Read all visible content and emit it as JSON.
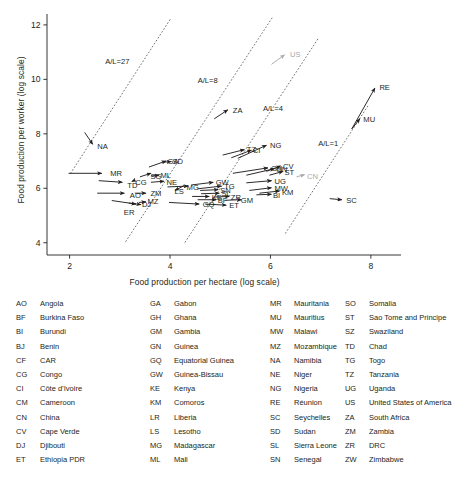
{
  "chart_data": {
    "type": "scatter",
    "title": "",
    "xlabel": "Food production per hectare (log scale)",
    "ylabel": "Food production per worker (log scale)",
    "xlim": [
      1.55,
      8.6
    ],
    "ylim": [
      3.55,
      12.4
    ],
    "xticks": [
      "2",
      "4",
      "6",
      "8"
    ],
    "xtick_values": [
      2,
      4,
      6,
      8
    ],
    "yticks": [
      "4",
      "6",
      "8",
      "10",
      "12"
    ],
    "ytick_values": [
      4,
      6,
      8,
      10,
      12
    ],
    "grid": false,
    "legend_position": "below-plot",
    "annotations": [
      {
        "label": "A/L=27",
        "x": 2.95,
        "y": 10.55,
        "type": "iso-line-label"
      },
      {
        "label": "A/L=8",
        "x": 4.75,
        "y": 9.85,
        "type": "iso-line-label"
      },
      {
        "label": "A/L=4",
        "x": 6.05,
        "y": 8.85,
        "type": "iso-line-label"
      },
      {
        "label": "A/L=1",
        "x": 7.15,
        "y": 7.55,
        "type": "iso-line-label"
      }
    ],
    "iso_lines": [
      {
        "label": "A/L=27",
        "x0": 2.02,
        "y0": 6.55,
        "x1": 4.02,
        "y1": 12.25
      },
      {
        "label": "A/L=8",
        "x0": 3.12,
        "y0": 4.05,
        "x1": 6.03,
        "y1": 12.25
      },
      {
        "label": "A/L=4",
        "x0": 4.3,
        "y0": 4.02,
        "x1": 6.95,
        "y1": 11.5
      },
      {
        "label": "A/L=1",
        "x0": 6.3,
        "y0": 4.35,
        "x1": 7.95,
        "y1": 9.05
      }
    ],
    "series": [
      {
        "name": "African countries (trajectory vectors)",
        "color": "#231f20",
        "arrows": [
          {
            "code": "NA",
            "x0": 2.3,
            "y0": 8.05,
            "x1": 2.46,
            "y1": 7.62,
            "lx": 2.52,
            "ly": 7.52
          },
          {
            "code": "MR",
            "x0": 1.98,
            "y0": 6.55,
            "x1": 2.64,
            "y1": 6.55,
            "lx": 2.78,
            "ly": 6.56
          },
          {
            "code": "TD",
            "x0": 2.58,
            "y0": 6.28,
            "x1": 3.05,
            "y1": 6.22,
            "lx": 3.12,
            "ly": 6.1
          },
          {
            "code": "AO",
            "x0": 2.55,
            "y0": 5.82,
            "x1": 3.09,
            "y1": 5.82,
            "lx": 3.17,
            "ly": 5.74
          },
          {
            "code": "ER",
            "x0": 2.84,
            "y0": 5.55,
            "x1": 3.32,
            "y1": 5.42,
            "lx": 3.05,
            "ly": 5.12
          },
          {
            "code": "DJ",
            "x0": 3.18,
            "y0": 5.46,
            "x1": 3.42,
            "y1": 5.4,
            "lx": 3.41,
            "ly": 5.4
          },
          {
            "code": "MZ",
            "x0": 3.38,
            "y0": 5.48,
            "x1": 3.52,
            "y1": 5.5,
            "lx": 3.52,
            "ly": 5.52
          },
          {
            "code": "CG",
            "x0": 3.3,
            "y0": 6.3,
            "x1": 3.24,
            "y1": 6.25,
            "lx": 3.28,
            "ly": 6.23
          },
          {
            "code": "ZM",
            "x0": 3.3,
            "y0": 5.82,
            "x1": 3.52,
            "y1": 5.82,
            "lx": 3.58,
            "ly": 5.8
          },
          {
            "code": "SG",
            "x0": 3.4,
            "y0": 6.42,
            "x1": 3.62,
            "y1": 6.55,
            "lx": 3.58,
            "ly": 6.45
          },
          {
            "code": "ML",
            "x0": 3.62,
            "y0": 6.45,
            "x1": 3.78,
            "y1": 6.48,
            "lx": 3.78,
            "ly": 6.47
          },
          {
            "code": "GA",
            "x0": 3.58,
            "y0": 6.78,
            "x1": 3.92,
            "y1": 7.0,
            "lx": 3.92,
            "ly": 6.98
          },
          {
            "code": "SD",
            "x0": 3.88,
            "y0": 6.96,
            "x1": 4.02,
            "y1": 6.98,
            "lx": 4.02,
            "ly": 6.97
          },
          {
            "code": "NE",
            "x0": 3.62,
            "y0": 6.22,
            "x1": 3.88,
            "y1": 6.26,
            "lx": 3.9,
            "ly": 6.22
          },
          {
            "code": "LS",
            "x0": 4.28,
            "y0": 6.1,
            "x1": 4.1,
            "y1": 5.92,
            "lx": 4.06,
            "ly": 5.88
          },
          {
            "code": "MG",
            "x0": 3.95,
            "y0": 6.05,
            "x1": 4.36,
            "y1": 6.08,
            "lx": 4.3,
            "ly": 6.02
          },
          {
            "code": "GW",
            "x0": 4.42,
            "y0": 6.12,
            "x1": 4.86,
            "y1": 6.22,
            "lx": 4.88,
            "ly": 6.2
          },
          {
            "code": "TG",
            "x0": 4.55,
            "y0": 5.98,
            "x1": 5.02,
            "y1": 6.08,
            "lx": 5.05,
            "ly": 6.06
          },
          {
            "code": "SN",
            "x0": 4.6,
            "y0": 5.92,
            "x1": 4.96,
            "y1": 5.95,
            "lx": 4.97,
            "ly": 5.92
          },
          {
            "code": "SL",
            "x0": 4.62,
            "y0": 5.8,
            "x1": 4.98,
            "y1": 5.82,
            "lx": 4.99,
            "ly": 5.8
          },
          {
            "code": "KE",
            "x0": 4.44,
            "y0": 5.7,
            "x1": 4.78,
            "y1": 5.7,
            "lx": 4.8,
            "ly": 5.68
          },
          {
            "code": "BF",
            "x0": 4.55,
            "y0": 5.58,
            "x1": 4.92,
            "y1": 5.58,
            "lx": 4.92,
            "ly": 5.56
          },
          {
            "code": "ZR",
            "x0": 4.88,
            "y0": 5.68,
            "x1": 5.18,
            "y1": 5.7,
            "lx": 5.18,
            "ly": 5.68
          },
          {
            "code": "GM",
            "x0": 5.1,
            "y0": 5.56,
            "x1": 5.42,
            "y1": 5.58,
            "lx": 5.38,
            "ly": 5.55
          },
          {
            "code": "GQ",
            "x0": 3.98,
            "y0": 5.48,
            "x1": 4.58,
            "y1": 5.42,
            "lx": 4.62,
            "ly": 5.4
          },
          {
            "code": "ET",
            "x0": 4.7,
            "y0": 5.42,
            "x1": 5.12,
            "y1": 5.38,
            "lx": 5.15,
            "ly": 5.36
          },
          {
            "code": "TZ",
            "x0": 5.05,
            "y0": 7.22,
            "x1": 5.48,
            "y1": 7.42,
            "lx": 5.5,
            "ly": 7.42
          },
          {
            "code": "CI",
            "x0": 5.22,
            "y0": 7.12,
            "x1": 5.62,
            "y1": 7.4,
            "lx": 5.62,
            "ly": 7.38
          },
          {
            "code": "NG",
            "x0": 5.35,
            "y0": 7.1,
            "x1": 5.92,
            "y1": 7.58,
            "lx": 5.96,
            "ly": 7.58
          },
          {
            "code": "GH",
            "x0": 5.25,
            "y0": 6.55,
            "x1": 5.95,
            "y1": 6.75,
            "lx": 5.98,
            "ly": 6.72
          },
          {
            "code": "GN",
            "x0": 5.52,
            "y0": 6.48,
            "x1": 6.08,
            "y1": 6.72,
            "lx": 6.08,
            "ly": 6.7
          },
          {
            "code": "CV",
            "x0": 5.92,
            "y0": 6.62,
            "x1": 6.2,
            "y1": 6.82,
            "lx": 6.22,
            "ly": 6.8
          },
          {
            "code": "ST",
            "x0": 5.98,
            "y0": 6.48,
            "x1": 6.25,
            "y1": 6.62,
            "lx": 6.25,
            "ly": 6.58
          },
          {
            "code": "UG",
            "x0": 5.52,
            "y0": 6.2,
            "x1": 6.02,
            "y1": 6.28,
            "lx": 6.05,
            "ly": 6.26
          },
          {
            "code": "MW",
            "x0": 5.58,
            "y0": 5.92,
            "x1": 6.02,
            "y1": 6.02,
            "lx": 6.05,
            "ly": 6.0
          },
          {
            "code": "KM",
            "x0": 5.78,
            "y0": 5.82,
            "x1": 6.18,
            "y1": 5.9,
            "lx": 6.2,
            "ly": 5.84
          },
          {
            "code": "BI",
            "x0": 5.72,
            "y0": 5.76,
            "x1": 6.02,
            "y1": 5.78,
            "lx": 6.02,
            "ly": 5.74
          },
          {
            "code": "SC",
            "x0": 7.18,
            "y0": 5.62,
            "x1": 7.42,
            "y1": 5.58,
            "lx": 7.48,
            "ly": 5.56
          },
          {
            "code": "MU",
            "x0": 7.62,
            "y0": 8.18,
            "x1": 7.78,
            "y1": 8.55,
            "lx": 7.82,
            "ly": 8.52
          },
          {
            "code": "RE",
            "x0": 7.62,
            "y0": 8.18,
            "x1": 8.08,
            "y1": 9.68,
            "lx": 8.14,
            "ly": 9.72
          },
          {
            "code": "ZA",
            "x0": 4.88,
            "y0": 8.55,
            "x1": 5.15,
            "y1": 8.88,
            "lx": 5.22,
            "ly": 8.86
          }
        ]
      },
      {
        "name": "Reference countries",
        "color": "#a7a9ac",
        "arrows": [
          {
            "code": "US",
            "x0": 6.02,
            "y0": 10.55,
            "x1": 6.28,
            "y1": 10.9,
            "lx": 6.36,
            "ly": 10.9
          },
          {
            "code": "CN",
            "x0": 6.52,
            "y0": 6.42,
            "x1": 6.68,
            "y1": 6.5,
            "lx": 6.7,
            "ly": 6.45
          }
        ]
      }
    ]
  },
  "legend": {
    "columns": [
      [
        {
          "code": "AO",
          "name": "Angola"
        },
        {
          "code": "BF",
          "name": "Burkina Faso"
        },
        {
          "code": "BI",
          "name": "Burundi"
        },
        {
          "code": "BJ",
          "name": "Benin"
        },
        {
          "code": "CF",
          "name": "CAR"
        },
        {
          "code": "CG",
          "name": "Congo"
        },
        {
          "code": "CI",
          "name": "Côte d’Ivoire"
        },
        {
          "code": "CM",
          "name": "Cameroon"
        },
        {
          "code": "CN",
          "name": "China"
        },
        {
          "code": "CV",
          "name": "Cape Verde"
        },
        {
          "code": "DJ",
          "name": "Djibouti"
        },
        {
          "code": "ET",
          "name": "Ethiopia PDR"
        }
      ],
      [
        {
          "code": "GA",
          "name": "Gabon"
        },
        {
          "code": "GH",
          "name": "Ghana"
        },
        {
          "code": "GM",
          "name": "Gambia"
        },
        {
          "code": "GN",
          "name": "Guinea"
        },
        {
          "code": "GQ",
          "name": "Equatorial Guinea"
        },
        {
          "code": "GW",
          "name": "Guinea-Bissau"
        },
        {
          "code": "KE",
          "name": "Kenya"
        },
        {
          "code": "KM",
          "name": "Comoros"
        },
        {
          "code": "LR",
          "name": "Liberia"
        },
        {
          "code": "LS",
          "name": "Lesotho"
        },
        {
          "code": "MG",
          "name": "Madagascar"
        },
        {
          "code": "ML",
          "name": "Mali"
        }
      ],
      [
        {
          "code": "MR",
          "name": "Mauritania"
        },
        {
          "code": "MU",
          "name": "Mauritius"
        },
        {
          "code": "MW",
          "name": "Malawi"
        },
        {
          "code": "MZ",
          "name": "Mozambique"
        },
        {
          "code": "NA",
          "name": "Namibia"
        },
        {
          "code": "NE",
          "name": "Niger"
        },
        {
          "code": "NG",
          "name": "Nigeria"
        },
        {
          "code": "RE",
          "name": "Réunion"
        },
        {
          "code": "SC",
          "name": "Seychelles"
        },
        {
          "code": "SD",
          "name": "Sudan"
        },
        {
          "code": "SL",
          "name": "Sierra Leone"
        },
        {
          "code": "SN",
          "name": "Senegal"
        }
      ],
      [
        {
          "code": "SO",
          "name": "Somalia"
        },
        {
          "code": "ST",
          "name": "Sao Tome and Principe"
        },
        {
          "code": "SZ",
          "name": "Swaziland"
        },
        {
          "code": "TD",
          "name": "Chad"
        },
        {
          "code": "TG",
          "name": "Togo"
        },
        {
          "code": "TZ",
          "name": "Tanzania"
        },
        {
          "code": "UG",
          "name": "Uganda"
        },
        {
          "code": "US",
          "name": "United States of America"
        },
        {
          "code": "ZA",
          "name": "South Africa"
        },
        {
          "code": "ZM",
          "name": "Zambia"
        },
        {
          "code": "ZR",
          "name": "DRC"
        },
        {
          "code": "ZW",
          "name": "Zimbabwe"
        }
      ]
    ]
  }
}
